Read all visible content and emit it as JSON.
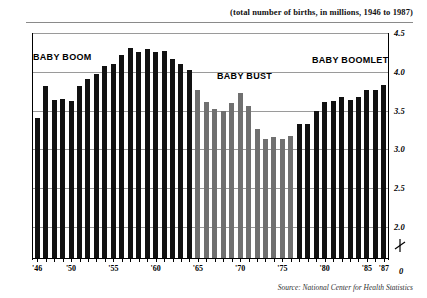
{
  "title": "(total number of births, in millions, 1946 to 1987)",
  "source": "Source: National Center for Health Statistics",
  "annotations": [
    {
      "id": "baby-boom",
      "label": "BABY BOOM"
    },
    {
      "id": "baby-bust",
      "label": "BABY BUST"
    },
    {
      "id": "baby-boomlet",
      "label": "BABY BOOMLET"
    }
  ],
  "y_axis": {
    "ticks": [
      "4.5",
      "4.0",
      "3.5",
      "3.0",
      "2.5",
      "2.0"
    ],
    "zero_label": "0",
    "axis_break": true
  },
  "x_axis": {
    "ticks": [
      "'46",
      "'50",
      "'55",
      "'60",
      "'65",
      "'70",
      "'75",
      "'80",
      "'85",
      "'87"
    ]
  },
  "colors": {
    "bar_dark": "#111111",
    "bar_light": "#707070",
    "gridline": "#9a9a9a",
    "axis": "#000000",
    "rule": "#8a8a8a"
  },
  "chart_data": {
    "type": "bar",
    "title": "(total number of births, in millions, 1946 to 1987)",
    "xlabel": "",
    "ylabel": "total number of births (millions)",
    "ylim": [
      1.6,
      4.5
    ],
    "yticks": [
      2.0,
      2.5,
      3.0,
      3.5,
      4.0,
      4.5
    ],
    "grid": true,
    "legend": "none",
    "note": "y-axis is broken below 2.0 (zero indicated at baseline)",
    "categories": [
      "1946",
      "1947",
      "1948",
      "1949",
      "1950",
      "1951",
      "1952",
      "1953",
      "1954",
      "1955",
      "1956",
      "1957",
      "1958",
      "1959",
      "1960",
      "1961",
      "1962",
      "1963",
      "1964",
      "1965",
      "1966",
      "1967",
      "1968",
      "1969",
      "1970",
      "1971",
      "1972",
      "1973",
      "1974",
      "1975",
      "1976",
      "1977",
      "1978",
      "1979",
      "1980",
      "1981",
      "1982",
      "1983",
      "1984",
      "1985",
      "1986",
      "1987"
    ],
    "values": [
      3.41,
      3.82,
      3.64,
      3.65,
      3.63,
      3.82,
      3.91,
      3.97,
      4.08,
      4.1,
      4.22,
      4.31,
      4.26,
      4.3,
      4.26,
      4.27,
      4.17,
      4.1,
      4.03,
      3.76,
      3.61,
      3.52,
      3.5,
      3.6,
      3.73,
      3.56,
      3.26,
      3.14,
      3.16,
      3.14,
      3.17,
      3.33,
      3.33,
      3.49,
      3.61,
      3.63,
      3.68,
      3.64,
      3.67,
      3.76,
      3.76,
      3.83
    ],
    "series_colors": [
      "dark",
      "dark",
      "dark",
      "dark",
      "dark",
      "dark",
      "dark",
      "dark",
      "dark",
      "dark",
      "dark",
      "dark",
      "dark",
      "dark",
      "dark",
      "dark",
      "dark",
      "dark",
      "dark",
      "light",
      "light",
      "light",
      "light",
      "light",
      "light",
      "light",
      "light",
      "light",
      "light",
      "light",
      "light",
      "dark",
      "dark",
      "dark",
      "dark",
      "dark",
      "dark",
      "dark",
      "dark",
      "dark",
      "dark",
      "dark"
    ],
    "tick_years": [
      "1946",
      "1950",
      "1955",
      "1960",
      "1965",
      "1970",
      "1975",
      "1980",
      "1985",
      "1987"
    ]
  }
}
